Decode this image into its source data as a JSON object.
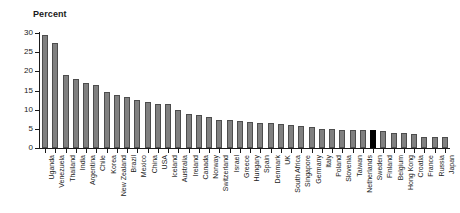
{
  "chart_data": {
    "type": "bar",
    "title": "Percent",
    "xlabel": "",
    "ylabel": "Percent",
    "ylim": [
      0,
      30
    ],
    "yticks": [
      0,
      5,
      10,
      15,
      20,
      25,
      30
    ],
    "grid": false,
    "legend": "none",
    "orientation": "vertical",
    "sorted": "descending",
    "bar_color": "#808080",
    "bar_edge_color": "#4d4d4d",
    "highlight_color": "#000000",
    "highlight_category": "Sweden",
    "categories": [
      "Uganda",
      "Venezuela",
      "Thailand",
      "India",
      "Argentina",
      "Chile",
      "Korea",
      "New Zealand",
      "Brazil",
      "Mexico",
      "China",
      "USA",
      "Iceland",
      "Australia",
      "Ireland",
      "Canada",
      "Norway",
      "Switzerland",
      "Israel",
      "Greece",
      "Hungary",
      "Spain",
      "Denmark",
      "UK",
      "South Africa",
      "Singapore",
      "Germany",
      "Italy",
      "Poland",
      "Slovenia",
      "Taiwan",
      "Netherlands",
      "Sweden",
      "Finland",
      "Belgium",
      "Hong Kong",
      "Croatia",
      "France",
      "Russia",
      "Japan"
    ],
    "values": [
      29.4,
      27.3,
      19.0,
      18.1,
      17.0,
      16.4,
      14.6,
      13.8,
      13.2,
      12.5,
      12.1,
      11.5,
      11.5,
      10.0,
      8.8,
      8.7,
      8.2,
      7.4,
      7.3,
      7.1,
      6.9,
      6.5,
      6.4,
      6.2,
      6.1,
      5.8,
      5.6,
      5.0,
      4.9,
      4.7,
      4.7,
      4.7,
      4.6,
      4.4,
      3.9,
      3.9,
      3.7,
      3.0,
      3.0,
      2.9
    ]
  }
}
